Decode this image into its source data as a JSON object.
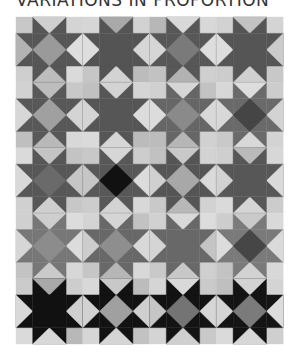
{
  "title": "VARIATIONS IN PROPORTION",
  "quilt": {
    "origin": [
      16,
      17
    ],
    "unit": [
      16.7,
      16.35
    ],
    "cols": 4,
    "rows": 5,
    "blocks": [
      [
        {
          "star": "#565656",
          "center": "#9a9a9a",
          "corners": [
            "#c8c8c8",
            "#d4d4d4",
            "#dadada",
            "#cfcfcf"
          ],
          "geese": [
            "#cfcfcf",
            "#dedede",
            "#bdbdbd",
            "#b3b3b3"
          ]
        },
        {
          "star": "#545454",
          "center": "#545454",
          "corners": [
            "#d6d6d6",
            "#d2d2d2",
            "#bcbcbc",
            "#c6c6c6"
          ],
          "geese": [
            "#a9a9a9",
            "#d6d6d6",
            "#d3d3d3",
            "#dedede"
          ]
        },
        {
          "star": "#575757",
          "center": "#7a7a7a",
          "corners": [
            "#b7b7b7",
            "#d8d8d8",
            "#cfcfcf",
            "#c2c2c2"
          ],
          "geese": [
            "#d9d9d9",
            "#dddddd",
            "#b2b2b2",
            "#d6d6d6"
          ]
        },
        {
          "star": "#555555",
          "center": "#555555",
          "corners": [
            "#d2d2d2",
            "#d4d4d4",
            "#c8c8c8",
            "#cccccc"
          ],
          "geese": [
            "#c3c3c3",
            "#cbcbcb",
            "#d0d0d0",
            "#dddddd"
          ]
        }
      ],
      [
        {
          "star": "#585858",
          "center": "#a0a0a0",
          "corners": [
            "#d2d2d2",
            "#c8c8c8",
            "#d8d8d8",
            "#bfbfbf"
          ],
          "geese": [
            "#bdbdbd",
            "#d4d4d4",
            "#b9b9b9",
            "#d7d7d7"
          ]
        },
        {
          "star": "#565656",
          "center": "#565656",
          "corners": [
            "#c0c0c0",
            "#d5d5d5",
            "#bbbbbb",
            "#dadada"
          ],
          "geese": [
            "#d3d3d3",
            "#dcdcdc",
            "#d6d6d6",
            "#d4d4d4"
          ]
        },
        {
          "star": "#666666",
          "center": "#8a8a8a",
          "corners": [
            "#d0d0d0",
            "#c2c2c2",
            "#d1d1d1",
            "#bcbcbc"
          ],
          "geese": [
            "#d6d6d6",
            "#d8d8d8",
            "#b6b6b6",
            "#dcdcdc"
          ]
        },
        {
          "star": "#6a6a6a",
          "center": "#454545",
          "corners": [
            "#d7d7d7",
            "#cccccc",
            "#d3d3d3",
            "#c9c9c9"
          ],
          "geese": [
            "#dddddd",
            "#d3d3d3",
            "#d8d8d8",
            "#d8d8d8"
          ]
        }
      ],
      [
        {
          "star": "#575757",
          "center": "#6a6a6a",
          "corners": [
            "#dadada",
            "#c3c3c3",
            "#c7c7c7",
            "#d0d0d0"
          ],
          "geese": [
            "#c4c4c4",
            "#c6c6c6",
            "#cfcfcf",
            "#d9d9d9"
          ]
        },
        {
          "star": "#585858",
          "center": "#111111",
          "corners": [
            "#c8c8c8",
            "#cdcdcd",
            "#d8d8d8",
            "#cccccc"
          ],
          "geese": [
            "#d6d6d6",
            "#dcdcdc",
            "#d3d3d3",
            "#c6c6c6"
          ]
        },
        {
          "star": "#555555",
          "center": "#a8a8a8",
          "corners": [
            "#c1c1c1",
            "#d3d3d3",
            "#d2d2d2",
            "#c9c9c9"
          ],
          "geese": [
            "#c9c9c9",
            "#dadada",
            "#b8b8b8",
            "#d0d0d0"
          ]
        },
        {
          "star": "#575757",
          "center": "#575757",
          "corners": [
            "#cfcfcf",
            "#d7d7d7",
            "#cccccc",
            "#dadada"
          ],
          "geese": [
            "#bababa",
            "#dadada",
            "#d5d5d5",
            "#d2d2d2"
          ]
        }
      ],
      [
        {
          "star": "#777777",
          "center": "#8c8c8c",
          "corners": [
            "#d0d0d0",
            "#dcdcdc",
            "#d7d7d7",
            "#c3c3c3"
          ],
          "geese": [
            "#cecece",
            "#dcdcdc",
            "#cacaca",
            "#d6d6d6"
          ]
        },
        {
          "star": "#686868",
          "center": "#8e8e8e",
          "corners": [
            "#d4d4d4",
            "#c2c2c2",
            "#d8d8d8",
            "#c6c6c6"
          ],
          "geese": [
            "#d5d5d5",
            "#d8d8d8",
            "#b6b6b6",
            "#cdcdcd"
          ]
        },
        {
          "star": "#686868",
          "center": "#686868",
          "corners": [
            "#d1d1d1",
            "#dcdcdc",
            "#cfcfcf",
            "#c9c9c9"
          ],
          "geese": [
            "#d9d9d9",
            "#c4c4c4",
            "#c8c8c8",
            "#d5d5d5"
          ]
        },
        {
          "star": "#7a7a7a",
          "center": "#464646",
          "corners": [
            "#cdcdcd",
            "#d9d9d9",
            "#d8d8d8",
            "#c3c3c3"
          ],
          "geese": [
            "#cacaca",
            "#dadada",
            "#d2d2d2",
            "#dcdcdc"
          ]
        }
      ],
      [
        {
          "star": "#111111",
          "center": "#111111",
          "corners": [
            "#cbcbcb",
            "#cdcdcd",
            "#b8b8b8",
            "#dadada"
          ],
          "geese": [
            "#a9a9a9",
            "#d0d0d0",
            "#d8d8d8",
            "#d9d9d9"
          ]
        },
        {
          "star": "#121212",
          "center": "#a0a0a0",
          "corners": [
            "#d8d8d8",
            "#bcbcbc",
            "#c2c2c2",
            "#d6d6d6"
          ],
          "geese": [
            "#c8c8c8",
            "#cfcfcf",
            "#d5d5d5",
            "#d2d2d2"
          ]
        },
        {
          "star": "#131313",
          "center": "#747474",
          "corners": [
            "#d5d5d5",
            "#cacaca",
            "#c9c9c9",
            "#d4d4d4"
          ],
          "geese": [
            "#d9d9d9",
            "#d6d6d6",
            "#cfcfcf",
            "#c5c5c5"
          ]
        },
        {
          "star": "#141414",
          "center": "#7b7b7b",
          "corners": [
            "#bfbfbf",
            "#d4d4d4",
            "#cfcfcf",
            "#dadada"
          ],
          "geese": [
            "#d3d3d3",
            "#dcdcdc",
            "#d7d7d7",
            "#d4d4d4"
          ]
        }
      ]
    ]
  }
}
